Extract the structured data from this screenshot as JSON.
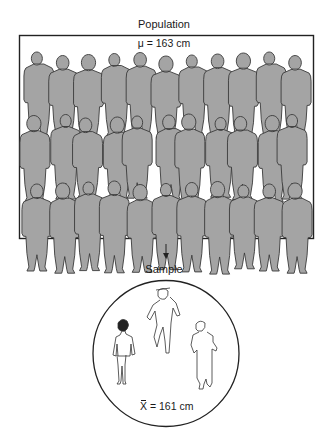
{
  "population": {
    "title": "Population",
    "mean_label": "μ = 163 cm",
    "rows": 3,
    "people_per_row": 11,
    "silhouette_color": "#a4a4a4",
    "outline_color": "#3a3a3a"
  },
  "arrow": {
    "direction": "down"
  },
  "sample": {
    "title": "Sample",
    "mean_symbol": "X",
    "mean_value": " = 161 cm",
    "people_count": 3
  }
}
